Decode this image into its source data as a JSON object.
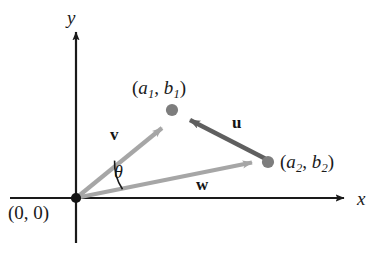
{
  "figure": {
    "background_color": "#ffffff",
    "axis_color": "#1a1a1a",
    "light_vector_color": "#a6a6a6",
    "dark_vector_color": "#5f5f5f",
    "point_color": "#7d7d7d",
    "arc_color": "#1a1a1a"
  },
  "axes": {
    "x_label": "x",
    "y_label": "y",
    "origin_label": "(0, 0)",
    "x_axis_start_px": 10,
    "x_axis_end_px": 352,
    "y_axis_top_px": 30,
    "y_axis_bottom_px": 243,
    "origin_px": [
      76,
      198
    ]
  },
  "points": [
    {
      "name": "point-a1b1",
      "label_text": "(a1, b1)",
      "label_parts": {
        "open": "(",
        "var1": "a",
        "sub1": "1",
        "sep": ", ",
        "var2": "b",
        "sub2": "1",
        "close": ")"
      },
      "position_px": [
        172,
        110
      ]
    },
    {
      "name": "point-a2b2",
      "label_text": "(a2, b2)",
      "label_parts": {
        "open": "(",
        "var1": "a",
        "sub1": "2",
        "sep": ", ",
        "var2": "b",
        "sub2": "2",
        "close": ")"
      },
      "position_px": [
        268,
        162
      ]
    }
  ],
  "vectors": [
    {
      "name": "vector-v",
      "label": "v",
      "style": "light",
      "from_px": [
        76,
        198
      ],
      "to_px": [
        169,
        122
      ],
      "description": "vector v from origin to (a1, b1)"
    },
    {
      "name": "vector-w",
      "label": "w",
      "style": "light",
      "from_px": [
        76,
        198
      ],
      "to_px": [
        262,
        161
      ],
      "description": "vector w from origin to (a2, b2)"
    },
    {
      "name": "vector-u",
      "label": "u",
      "style": "dark",
      "from_px": [
        264,
        158
      ],
      "to_px": [
        181,
        115
      ],
      "description": "vector u from (a2, b2) to (a1, b1)"
    }
  ],
  "angle": {
    "name": "angle-theta",
    "label": "θ",
    "vertex_px": [
      76,
      198
    ],
    "between": [
      "vector-v",
      "vector-w"
    ],
    "radius_px": 46
  }
}
